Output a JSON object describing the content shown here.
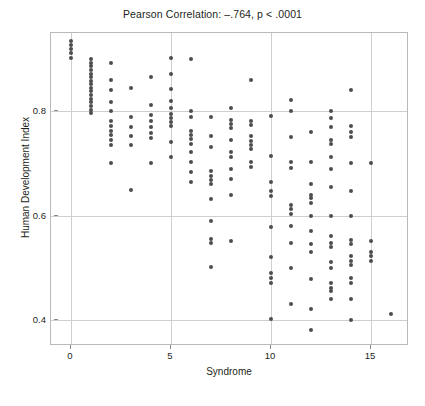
{
  "chart_data": {
    "type": "scatter",
    "title": "Pearson Correlation: –.764, p < .0001",
    "xlabel": "Syndrome",
    "ylabel": "Human Development Index",
    "xlim": [
      -1,
      16.9
    ],
    "ylim": [
      0.35,
      0.95
    ],
    "xticks": [
      0,
      5,
      10,
      15
    ],
    "xtick_labels": [
      "0",
      "5",
      "10",
      "15"
    ],
    "yticks": [
      0.4,
      0.6,
      0.8
    ],
    "ytick_labels": [
      "0.4",
      "0.6",
      "0.8"
    ],
    "grid": true,
    "legend": false,
    "marker_color": "#4d4d4d",
    "statistics": {
      "pearson_r": -0.764,
      "p_value_label": "p < .0001"
    },
    "points": [
      [
        0,
        0.935
      ],
      [
        0,
        0.928
      ],
      [
        0,
        0.919
      ],
      [
        0,
        0.912
      ],
      [
        0,
        0.902
      ],
      [
        1,
        0.901
      ],
      [
        1,
        0.893
      ],
      [
        1,
        0.886
      ],
      [
        1,
        0.879
      ],
      [
        1,
        0.872
      ],
      [
        1,
        0.866
      ],
      [
        1,
        0.859
      ],
      [
        1,
        0.852
      ],
      [
        1,
        0.845
      ],
      [
        1,
        0.838
      ],
      [
        1,
        0.831
      ],
      [
        1,
        0.824
      ],
      [
        1,
        0.817
      ],
      [
        1,
        0.81
      ],
      [
        1,
        0.803
      ],
      [
        1,
        0.796
      ],
      [
        2,
        0.892
      ],
      [
        2,
        0.86
      ],
      [
        2,
        0.841
      ],
      [
        2,
        0.818
      ],
      [
        2,
        0.8
      ],
      [
        2,
        0.781
      ],
      [
        2,
        0.772
      ],
      [
        2,
        0.763
      ],
      [
        2,
        0.754
      ],
      [
        2,
        0.745
      ],
      [
        2,
        0.736
      ],
      [
        2,
        0.7
      ],
      [
        3,
        0.845
      ],
      [
        3,
        0.79
      ],
      [
        3,
        0.769
      ],
      [
        3,
        0.752
      ],
      [
        3,
        0.735
      ],
      [
        3,
        0.65
      ],
      [
        4,
        0.866
      ],
      [
        4,
        0.812
      ],
      [
        4,
        0.793
      ],
      [
        4,
        0.781
      ],
      [
        4,
        0.77
      ],
      [
        4,
        0.759
      ],
      [
        4,
        0.748
      ],
      [
        4,
        0.7
      ],
      [
        5,
        0.903
      ],
      [
        5,
        0.872
      ],
      [
        5,
        0.843
      ],
      [
        5,
        0.82
      ],
      [
        5,
        0.806
      ],
      [
        5,
        0.795
      ],
      [
        5,
        0.787
      ],
      [
        5,
        0.779
      ],
      [
        5,
        0.771
      ],
      [
        5,
        0.742
      ],
      [
        5,
        0.712
      ],
      [
        6,
        0.9
      ],
      [
        6,
        0.801
      ],
      [
        6,
        0.789
      ],
      [
        6,
        0.762
      ],
      [
        6,
        0.754
      ],
      [
        6,
        0.746
      ],
      [
        6,
        0.738
      ],
      [
        6,
        0.722
      ],
      [
        6,
        0.703
      ],
      [
        6,
        0.684
      ],
      [
        6,
        0.665
      ],
      [
        7,
        0.79
      ],
      [
        7,
        0.752
      ],
      [
        7,
        0.731
      ],
      [
        7,
        0.685
      ],
      [
        7,
        0.676
      ],
      [
        7,
        0.668
      ],
      [
        7,
        0.66
      ],
      [
        7,
        0.631
      ],
      [
        7,
        0.59
      ],
      [
        7,
        0.555
      ],
      [
        7,
        0.548
      ],
      [
        7,
        0.501
      ],
      [
        8,
        0.806
      ],
      [
        8,
        0.784
      ],
      [
        8,
        0.776
      ],
      [
        8,
        0.768
      ],
      [
        8,
        0.745
      ],
      [
        8,
        0.722
      ],
      [
        8,
        0.713
      ],
      [
        8,
        0.689
      ],
      [
        8,
        0.671
      ],
      [
        8,
        0.64
      ],
      [
        8,
        0.551
      ],
      [
        9,
        0.86
      ],
      [
        9,
        0.782
      ],
      [
        9,
        0.773
      ],
      [
        9,
        0.752
      ],
      [
        9,
        0.744
      ],
      [
        9,
        0.736
      ],
      [
        9,
        0.728
      ],
      [
        9,
        0.702
      ],
      [
        9,
        0.693
      ],
      [
        10,
        0.791
      ],
      [
        10,
        0.715
      ],
      [
        10,
        0.665
      ],
      [
        10,
        0.648
      ],
      [
        10,
        0.638
      ],
      [
        10,
        0.578
      ],
      [
        10,
        0.521
      ],
      [
        10,
        0.49
      ],
      [
        10,
        0.48
      ],
      [
        10,
        0.47
      ],
      [
        10,
        0.402
      ],
      [
        11,
        0.822
      ],
      [
        11,
        0.8
      ],
      [
        11,
        0.75
      ],
      [
        11,
        0.702
      ],
      [
        11,
        0.691
      ],
      [
        11,
        0.62
      ],
      [
        11,
        0.612
      ],
      [
        11,
        0.604
      ],
      [
        11,
        0.58
      ],
      [
        11,
        0.548
      ],
      [
        11,
        0.5
      ],
      [
        11,
        0.43
      ],
      [
        12,
        0.76
      ],
      [
        12,
        0.703
      ],
      [
        12,
        0.66
      ],
      [
        12,
        0.64
      ],
      [
        12,
        0.633
      ],
      [
        12,
        0.625
      ],
      [
        12,
        0.6
      ],
      [
        12,
        0.57
      ],
      [
        12,
        0.545
      ],
      [
        12,
        0.53
      ],
      [
        12,
        0.478
      ],
      [
        12,
        0.421
      ],
      [
        12,
        0.38
      ],
      [
        13,
        0.801
      ],
      [
        13,
        0.787
      ],
      [
        13,
        0.77
      ],
      [
        13,
        0.745
      ],
      [
        13,
        0.738
      ],
      [
        13,
        0.712
      ],
      [
        13,
        0.69
      ],
      [
        13,
        0.655
      ],
      [
        13,
        0.6
      ],
      [
        13,
        0.56
      ],
      [
        13,
        0.548
      ],
      [
        13,
        0.54
      ],
      [
        13,
        0.512
      ],
      [
        13,
        0.5
      ],
      [
        13,
        0.47
      ],
      [
        13,
        0.462
      ],
      [
        13,
        0.455
      ],
      [
        13,
        0.44
      ],
      [
        14,
        0.84
      ],
      [
        14,
        0.771
      ],
      [
        14,
        0.761
      ],
      [
        14,
        0.751
      ],
      [
        14,
        0.7
      ],
      [
        14,
        0.648
      ],
      [
        14,
        0.6
      ],
      [
        14,
        0.553
      ],
      [
        14,
        0.545
      ],
      [
        14,
        0.522
      ],
      [
        14,
        0.513
      ],
      [
        14,
        0.505
      ],
      [
        14,
        0.48
      ],
      [
        14,
        0.47
      ],
      [
        14,
        0.441
      ],
      [
        14,
        0.4
      ],
      [
        15,
        0.7
      ],
      [
        15,
        0.552
      ],
      [
        15,
        0.531
      ],
      [
        15,
        0.522
      ],
      [
        15,
        0.513
      ],
      [
        16,
        0.412
      ]
    ]
  }
}
